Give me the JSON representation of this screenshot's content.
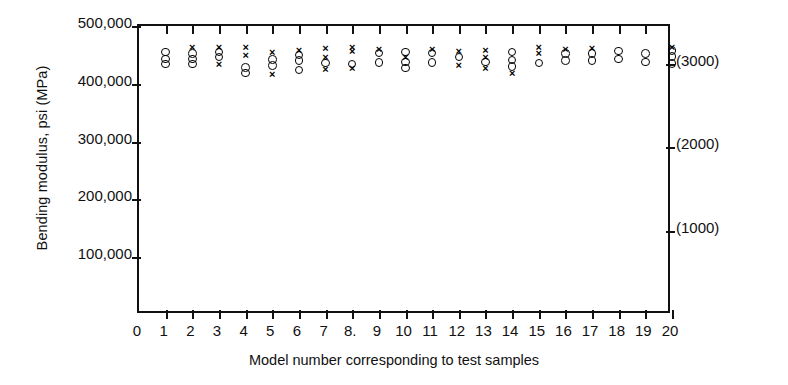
{
  "chart_data": {
    "type": "scatter",
    "title": "",
    "xlabel": "Model number corresponding to test samples",
    "ylabel": "Bending modulus, psi (MPa)",
    "xlim": [
      0,
      20
    ],
    "ylim": [
      0,
      500000
    ],
    "grid": false,
    "legend_position": "none",
    "y_ticks": [
      100000,
      200000,
      300000,
      400000,
      500000
    ],
    "y_tick_labels": [
      "100,000",
      "200,000",
      "300,000",
      "400,000",
      "500,000"
    ],
    "x_ticks": [
      0,
      1,
      2,
      3,
      4,
      5,
      6,
      7,
      8,
      9,
      10,
      11,
      12,
      13,
      14,
      15,
      16,
      17,
      18,
      19,
      20
    ],
    "x_tick_labels": [
      "0",
      "1",
      "2",
      "3",
      "4",
      "5",
      "6",
      "7",
      "8.",
      "9",
      "10",
      "11",
      "12",
      "13",
      "14",
      "15",
      "16",
      "17",
      "18",
      "19",
      "20"
    ],
    "secondary_y_axis": {
      "label": "MPa",
      "ticks": [
        1000,
        2000,
        3000
      ],
      "tick_labels": [
        "(1000)",
        "(2000)",
        "(3000)"
      ],
      "tick_positions_psi": [
        145000,
        290000,
        435000
      ]
    },
    "series": [
      {
        "name": "circle-marker-series",
        "marker": "o",
        "points": [
          {
            "x": 1,
            "y": 455000
          },
          {
            "x": 1,
            "y": 443000
          },
          {
            "x": 1,
            "y": 434000
          },
          {
            "x": 2,
            "y": 452000
          },
          {
            "x": 2,
            "y": 443000
          },
          {
            "x": 2,
            "y": 434000
          },
          {
            "x": 3,
            "y": 455000
          },
          {
            "x": 3,
            "y": 446000
          },
          {
            "x": 4,
            "y": 428000
          },
          {
            "x": 4,
            "y": 419000
          },
          {
            "x": 5,
            "y": 442000
          },
          {
            "x": 5,
            "y": 432000
          },
          {
            "x": 6,
            "y": 450000
          },
          {
            "x": 6,
            "y": 440000
          },
          {
            "x": 6,
            "y": 424000
          },
          {
            "x": 7,
            "y": 436000
          },
          {
            "x": 8,
            "y": 434000
          },
          {
            "x": 9,
            "y": 453000
          },
          {
            "x": 9,
            "y": 437000
          },
          {
            "x": 10,
            "y": 455000
          },
          {
            "x": 10,
            "y": 438000
          },
          {
            "x": 10,
            "y": 427000
          },
          {
            "x": 11,
            "y": 453000
          },
          {
            "x": 11,
            "y": 437000
          },
          {
            "x": 12,
            "y": 446000
          },
          {
            "x": 13,
            "y": 438000
          },
          {
            "x": 14,
            "y": 455000
          },
          {
            "x": 14,
            "y": 441000
          },
          {
            "x": 14,
            "y": 430000
          },
          {
            "x": 15,
            "y": 436000
          },
          {
            "x": 16,
            "y": 452000
          },
          {
            "x": 16,
            "y": 440000
          },
          {
            "x": 17,
            "y": 452000
          },
          {
            "x": 17,
            "y": 440000
          },
          {
            "x": 18,
            "y": 457000
          },
          {
            "x": 18,
            "y": 443000
          },
          {
            "x": 19,
            "y": 452000
          },
          {
            "x": 19,
            "y": 438000
          },
          {
            "x": 20,
            "y": 458000
          },
          {
            "x": 20,
            "y": 447000
          },
          {
            "x": 20,
            "y": 435000
          }
        ]
      },
      {
        "name": "cross-marker-series",
        "marker": "x",
        "points": [
          {
            "x": 2,
            "y": 464000
          },
          {
            "x": 3,
            "y": 463000
          },
          {
            "x": 3,
            "y": 435000
          },
          {
            "x": 4,
            "y": 463000
          },
          {
            "x": 4,
            "y": 450000
          },
          {
            "x": 5,
            "y": 455000
          },
          {
            "x": 5,
            "y": 417000
          },
          {
            "x": 6,
            "y": 458000
          },
          {
            "x": 7,
            "y": 462000
          },
          {
            "x": 7,
            "y": 447000
          },
          {
            "x": 7,
            "y": 425000
          },
          {
            "x": 8,
            "y": 464000
          },
          {
            "x": 8,
            "y": 456000
          },
          {
            "x": 8,
            "y": 428000
          },
          {
            "x": 9,
            "y": 461000
          },
          {
            "x": 10,
            "y": 446000
          },
          {
            "x": 11,
            "y": 461000
          },
          {
            "x": 12,
            "y": 457000
          },
          {
            "x": 12,
            "y": 432000
          },
          {
            "x": 13,
            "y": 459000
          },
          {
            "x": 13,
            "y": 446000
          },
          {
            "x": 13,
            "y": 428000
          },
          {
            "x": 14,
            "y": 419000
          },
          {
            "x": 15,
            "y": 463000
          },
          {
            "x": 15,
            "y": 454000
          },
          {
            "x": 16,
            "y": 461000
          },
          {
            "x": 17,
            "y": 462000
          },
          {
            "x": 20,
            "y": 463000
          }
        ]
      }
    ]
  }
}
